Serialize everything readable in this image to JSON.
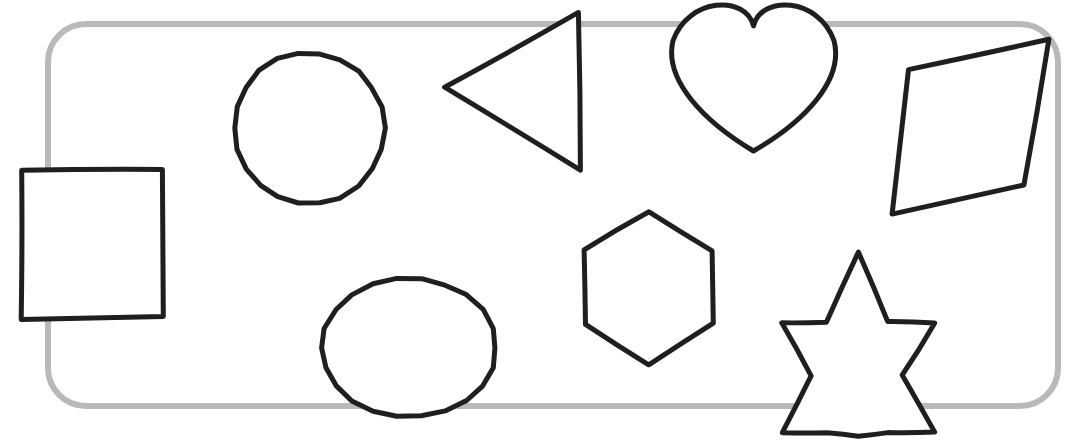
{
  "scene": {
    "title": "Hand-drawn geometric shapes inside a rounded rectangle border",
    "description": "A worksheet-style line drawing of nine outlined shapes arranged inside and overlapping a light-grey rounded rectangle frame.",
    "background_color": "#ffffff",
    "width": 1068,
    "height": 447
  },
  "frame": {
    "name": "rounded-rectangle-border",
    "label": "Rounded rectangle frame",
    "color": "#b9b9b9",
    "stroke_width": 6,
    "corner_radius": 38,
    "x": 48,
    "y": 24,
    "w": 1010,
    "h": 382
  },
  "style": {
    "ink_color": "#1f1f1f",
    "ink_width": 5,
    "fill": "#ffffff"
  },
  "shapes": [
    {
      "name": "square",
      "label": "Square",
      "kind": "polygon",
      "filled": true,
      "count_sides": 4,
      "bbox": [
        20,
        169,
        143,
        150
      ],
      "points": [
        [
          21,
          171
        ],
        [
          163,
          169
        ],
        [
          163,
          317
        ],
        [
          22,
          319
        ]
      ]
    },
    {
      "name": "circle",
      "label": "Circle",
      "kind": "ellipse",
      "filled": true,
      "count_sides": 0,
      "bbox": [
        234,
        52,
        151,
        153
      ],
      "cx": 309,
      "cy": 128,
      "rx": 75,
      "ry": 76
    },
    {
      "name": "triangle",
      "label": "Triangle",
      "kind": "polygon",
      "filled": true,
      "count_sides": 3,
      "bbox": [
        444,
        13,
        138,
        159
      ],
      "points": [
        [
          578,
          13
        ],
        [
          444,
          87
        ],
        [
          580,
          171
        ]
      ]
    },
    {
      "name": "heart",
      "label": "Heart",
      "kind": "heart",
      "filled": true,
      "count_sides": 0,
      "bbox": [
        671,
        3,
        165,
        148
      ],
      "cx": 753,
      "cy": 72
    },
    {
      "name": "parallelogram",
      "label": "Parallelogram",
      "kind": "polygon",
      "filled": true,
      "count_sides": 4,
      "bbox": [
        890,
        38,
        160,
        177
      ],
      "points": [
        [
          1048,
          39
        ],
        [
          909,
          70
        ],
        [
          892,
          214
        ],
        [
          1024,
          185
        ]
      ]
    },
    {
      "name": "ellipse",
      "label": "Ellipse",
      "kind": "ellipse",
      "filled": true,
      "count_sides": 0,
      "bbox": [
        322,
        278,
        175,
        140
      ],
      "cx": 409,
      "cy": 348,
      "rx": 87,
      "ry": 70
    },
    {
      "name": "hexagon",
      "label": "Hexagon",
      "kind": "polygon",
      "filled": true,
      "count_sides": 6,
      "bbox": [
        584,
        210,
        132,
        155
      ],
      "points": [
        [
          648,
          211
        ],
        [
          712,
          250
        ],
        [
          714,
          324
        ],
        [
          649,
          364
        ],
        [
          586,
          325
        ],
        [
          585,
          249
        ]
      ]
    },
    {
      "name": "six-pointed-star",
      "label": "Six-pointed star",
      "kind": "star",
      "filled": true,
      "count_sides": 12,
      "bbox": [
        779,
        252,
        156,
        185
      ],
      "points": [
        [
          858,
          253
        ],
        [
          888,
          322
        ],
        [
          934,
          323
        ],
        [
          903,
          375
        ],
        [
          934,
          432
        ],
        [
          888,
          432
        ],
        [
          858,
          436
        ],
        [
          828,
          433
        ],
        [
          782,
          433
        ],
        [
          812,
          375
        ],
        [
          781,
          323
        ],
        [
          827,
          322
        ]
      ]
    }
  ],
  "legend": {
    "shape_names": [
      "Square",
      "Circle",
      "Triangle",
      "Heart",
      "Parallelogram",
      "Ellipse",
      "Hexagon",
      "Six-pointed star"
    ]
  }
}
